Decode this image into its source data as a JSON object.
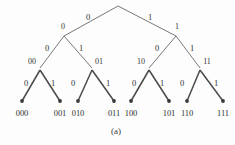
{
  "figure": {
    "caption": "(a)",
    "type": "binary-code-tree",
    "root_label": "",
    "stroke_color": "#555555",
    "leaf_dot_color": "#3a3a3a",
    "text_color": "#333333"
  },
  "nodes": {
    "root": {
      "x": 118,
      "y": 6,
      "label": ""
    },
    "level1": [
      {
        "id": "n0",
        "x": 64,
        "y": 36,
        "label": "0"
      },
      {
        "id": "n1",
        "x": 176,
        "y": 36,
        "label": "1"
      }
    ],
    "level2": [
      {
        "id": "n00",
        "x": 40,
        "y": 68,
        "label": "00"
      },
      {
        "id": "n01",
        "x": 92,
        "y": 68,
        "label": "01"
      },
      {
        "id": "n10",
        "x": 149,
        "y": 68,
        "label": "10"
      },
      {
        "id": "n11",
        "x": 200,
        "y": 68,
        "label": "11"
      }
    ],
    "leaves": [
      {
        "id": "l000",
        "x": 22,
        "y": 101,
        "label": "000"
      },
      {
        "id": "l001",
        "x": 60,
        "y": 101,
        "label": "001"
      },
      {
        "id": "l010",
        "x": 78,
        "y": 101,
        "label": "010"
      },
      {
        "id": "l011",
        "x": 114,
        "y": 101,
        "label": "011"
      },
      {
        "id": "l100",
        "x": 131,
        "y": 101,
        "label": "100"
      },
      {
        "id": "l101",
        "x": 169,
        "y": 101,
        "label": "101"
      },
      {
        "id": "l110",
        "x": 187,
        "y": 101,
        "label": "110"
      },
      {
        "id": "l111",
        "x": 223,
        "y": 101,
        "label": "111"
      }
    ]
  },
  "edge_labels": {
    "level1": [
      {
        "id": "e-root-0",
        "text": "0",
        "x": 88,
        "y": 17
      },
      {
        "id": "e-root-1",
        "text": "1",
        "x": 150,
        "y": 17
      }
    ],
    "level2": [
      {
        "id": "e-0-00",
        "text": "0",
        "x": 47,
        "y": 48
      },
      {
        "id": "e-0-01",
        "text": "1",
        "x": 81,
        "y": 48
      },
      {
        "id": "e-1-10",
        "text": "0",
        "x": 157,
        "y": 48
      },
      {
        "id": "e-1-11",
        "text": "1",
        "x": 192,
        "y": 48
      }
    ],
    "level3": [
      {
        "id": "e-00-000",
        "text": "0",
        "x": 26,
        "y": 83
      },
      {
        "id": "e-00-001",
        "text": "1",
        "x": 53,
        "y": 83
      },
      {
        "id": "e-01-010",
        "text": "0",
        "x": 73,
        "y": 83
      },
      {
        "id": "e-01-011",
        "text": "1",
        "x": 108,
        "y": 83
      },
      {
        "id": "e-10-100",
        "text": "0",
        "x": 134,
        "y": 83
      },
      {
        "id": "e-10-101",
        "text": "1",
        "x": 162,
        "y": 83
      },
      {
        "id": "e-11-110",
        "text": "0",
        "x": 182,
        "y": 83
      },
      {
        "id": "e-11-111",
        "text": "1",
        "x": 216,
        "y": 83
      }
    ]
  },
  "leaf_labels": {
    "y": 113,
    "items": [
      {
        "text": "000",
        "x": 22
      },
      {
        "text": "001",
        "x": 60
      },
      {
        "text": "010",
        "x": 78
      },
      {
        "text": "011",
        "x": 114
      },
      {
        "text": "100",
        "x": 131
      },
      {
        "text": "101",
        "x": 169
      },
      {
        "text": "110",
        "x": 187
      },
      {
        "text": "111",
        "x": 223
      }
    ]
  },
  "caption_pos": {
    "x": 116,
    "y": 131
  }
}
